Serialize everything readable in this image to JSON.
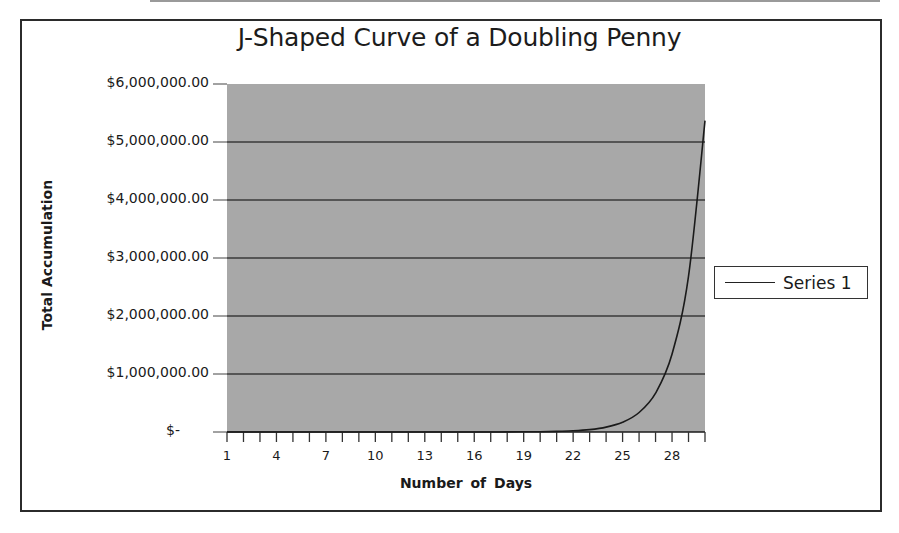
{
  "chart_data": {
    "type": "line",
    "title": "J-Shaped Curve of a Doubling Penny",
    "xlabel": "Number of Days",
    "ylabel": "Total Accumulation",
    "ylim": [
      0,
      6000000
    ],
    "xlim": [
      1,
      30
    ],
    "grid": {
      "horizontal": true,
      "vertical": false
    },
    "legend_position": "right",
    "y_ticks": [
      "$-",
      "$1,000,000.00",
      "$2,000,000.00",
      "$3,000,000.00",
      "$4,000,000.00",
      "$5,000,000.00",
      "$6,000,000.00"
    ],
    "x_tick_labels": [
      "1",
      "4",
      "7",
      "10",
      "13",
      "16",
      "19",
      "22",
      "25",
      "28"
    ],
    "series": [
      {
        "name": "Series 1",
        "color": "#1a1a1a",
        "x": [
          1,
          2,
          3,
          4,
          5,
          6,
          7,
          8,
          9,
          10,
          11,
          12,
          13,
          14,
          15,
          16,
          17,
          18,
          19,
          20,
          21,
          22,
          23,
          24,
          25,
          26,
          27,
          28,
          29,
          30
        ],
        "values": [
          0.01,
          0.02,
          0.04,
          0.08,
          0.16,
          0.32,
          0.64,
          1.28,
          2.56,
          5.12,
          10.24,
          20.48,
          40.96,
          81.92,
          163.84,
          327.68,
          655.36,
          1310.72,
          2621.44,
          5242.88,
          10485.76,
          20971.52,
          41943.04,
          83886.08,
          167772.16,
          335544.32,
          671088.64,
          1342177.28,
          2684354.56,
          5368709.12
        ]
      }
    ]
  },
  "colors": {
    "plot_background": "#a8a8a8",
    "gridline": "#3a3a3a",
    "frame": "#2b2b2b"
  },
  "legend": {
    "label": "Series 1"
  }
}
